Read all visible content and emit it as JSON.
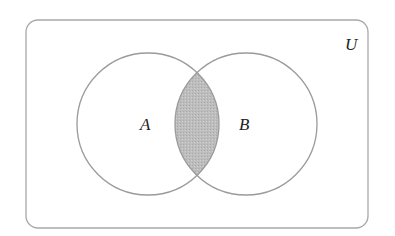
{
  "diagram": {
    "type": "venn",
    "universe": {
      "label": "U",
      "x": 26,
      "y": 20,
      "width": 342,
      "height": 208,
      "radius": 12
    },
    "sets": [
      {
        "label": "A",
        "cx": 148,
        "cy": 124,
        "r": 71,
        "label_x": 146,
        "label_y": 130
      },
      {
        "label": "B",
        "cx": 246,
        "cy": 124,
        "r": 71,
        "label_x": 246,
        "label_y": 130
      }
    ],
    "shaded_region": "A ∩ B",
    "colors": {
      "stroke": "#9a9a9a",
      "shade": "#b8b8b8",
      "shade_stroke": "#777777"
    }
  }
}
